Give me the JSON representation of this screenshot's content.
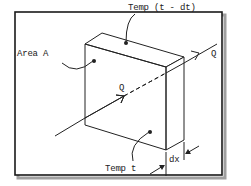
{
  "diagram": {
    "type": "heat-conduction-slab",
    "labels": {
      "area": "Area A",
      "temp_hot": "Temp (t - dt)",
      "temp_cold": "Temp t",
      "heat_flow_in": "Q",
      "heat_flow_out": "Q",
      "thickness": "dx"
    },
    "colors": {
      "line": "#222222",
      "frame": "#1a1a1a",
      "shadow": "#9a9a9a",
      "background": "#ffffff"
    }
  }
}
